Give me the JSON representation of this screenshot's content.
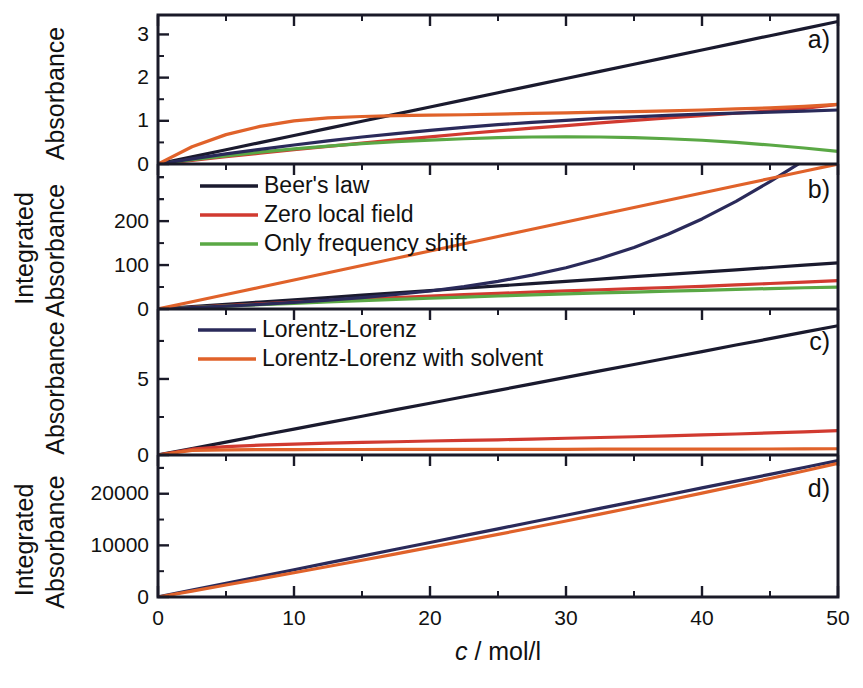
{
  "figure": {
    "xaxis": {
      "label_var": "c",
      "label_rest": " / mol/l",
      "ticks": [
        "0",
        "10",
        "20",
        "30",
        "40",
        "50"
      ],
      "min": 0,
      "max": 50
    },
    "panels": [
      {
        "tag": "a)",
        "ylabel": "Absorbance",
        "yticks": [
          "0",
          "1",
          "2",
          "3"
        ],
        "ymin": 0,
        "ymax": 3.45
      },
      {
        "tag": "b)",
        "ylabel_line1": "Integrated",
        "ylabel_line2": "Absorbance",
        "yticks": [
          "0",
          "100",
          "200"
        ],
        "ymin": 0,
        "ymax": 330
      },
      {
        "tag": "c)",
        "ylabel": "Absorbance",
        "yticks": [
          "0",
          "5"
        ],
        "ymin": 0,
        "ymax": 9.6
      },
      {
        "tag": "d)",
        "ylabel_line1": "Integrated",
        "ylabel_line2": "Absorbance",
        "yticks": [
          "0",
          "10000",
          "20000"
        ],
        "ymin": 0,
        "ymax": 27500
      }
    ],
    "legend_top": {
      "items": [
        {
          "label": "Beer's law",
          "color": "#1a1a2e"
        },
        {
          "label": "Zero local field",
          "color": "#d13a30"
        },
        {
          "label": "Only frequency shift",
          "color": "#5aa845"
        }
      ]
    },
    "legend_bottom": {
      "items": [
        {
          "label": "Lorentz-Lorenz",
          "color": "#2a2a5a"
        },
        {
          "label": "Lorentz-Lorenz with solvent",
          "color": "#e0622a"
        }
      ]
    },
    "colors": {
      "beers_law": "#1a1a2e",
      "zero_local_field": "#d13a30",
      "only_frequency_shift": "#5aa845",
      "lorentz_lorenz": "#2a2a5a",
      "lorentz_lorenz_solvent": "#e0622a"
    }
  },
  "chart_data": {
    "type": "line",
    "title": "",
    "xlabel": "c / mol/l",
    "grid": false,
    "legend_position": "inside-upper-left",
    "x": [
      0,
      2.5,
      5,
      7.5,
      10,
      12.5,
      15,
      17.5,
      20,
      22.5,
      25,
      27.5,
      30,
      32.5,
      35,
      37.5,
      40,
      42.5,
      45,
      47.5,
      50
    ],
    "panels": [
      {
        "tag": "a)",
        "ylabel": "Absorbance",
        "ylim": [
          0,
          3.45
        ],
        "yticks": [
          0,
          1,
          2,
          3
        ],
        "series": [
          {
            "name": "Beer's law",
            "color": "#1a1a2e",
            "values": [
              0,
              0.165,
              0.33,
              0.495,
              0.66,
              0.825,
              0.99,
              1.155,
              1.32,
              1.485,
              1.65,
              1.815,
              1.98,
              2.145,
              2.31,
              2.475,
              2.64,
              2.805,
              2.97,
              3.135,
              3.3
            ]
          },
          {
            "name": "Zero local field",
            "color": "#d13a30",
            "values": [
              0,
              0.085,
              0.17,
              0.25,
              0.33,
              0.41,
              0.485,
              0.56,
              0.63,
              0.7,
              0.765,
              0.83,
              0.89,
              0.95,
              1.01,
              1.065,
              1.12,
              1.175,
              1.23,
              1.29,
              1.38
            ]
          },
          {
            "name": "Only frequency shift",
            "color": "#5aa845",
            "values": [
              0,
              0.1,
              0.19,
              0.275,
              0.35,
              0.415,
              0.47,
              0.515,
              0.555,
              0.585,
              0.61,
              0.625,
              0.63,
              0.625,
              0.61,
              0.585,
              0.55,
              0.5,
              0.44,
              0.37,
              0.29
            ]
          },
          {
            "name": "Lorentz-Lorenz",
            "color": "#2a2a5a",
            "values": [
              0,
              0.12,
              0.235,
              0.34,
              0.44,
              0.535,
              0.625,
              0.705,
              0.78,
              0.85,
              0.91,
              0.965,
              1.01,
              1.055,
              1.09,
              1.125,
              1.155,
              1.18,
              1.2,
              1.225,
              1.25
            ]
          },
          {
            "name": "Lorentz-Lorenz with solvent",
            "color": "#e0622a",
            "values": [
              0,
              0.4,
              0.68,
              0.87,
              1.0,
              1.07,
              1.1,
              1.12,
              1.13,
              1.14,
              1.155,
              1.17,
              1.185,
              1.2,
              1.215,
              1.23,
              1.25,
              1.275,
              1.3,
              1.335,
              1.38
            ]
          }
        ]
      },
      {
        "tag": "b)",
        "ylabel": "Integrated Absorbance",
        "ylim": [
          0,
          330
        ],
        "yticks": [
          0,
          100,
          200
        ],
        "series": [
          {
            "name": "Beer's law",
            "color": "#1a1a2e",
            "values": [
              0,
              5.2,
              10.5,
              15.8,
              21.0,
              26.2,
              31.5,
              36.8,
              42.0,
              47.2,
              52.5,
              57.8,
              63.0,
              68.2,
              73.5,
              78.8,
              84.0,
              89.2,
              94.5,
              99.8,
              105.0
            ]
          },
          {
            "name": "Zero local field",
            "color": "#d13a30",
            "values": [
              0,
              4.0,
              8.0,
              11.8,
              15.5,
              19.2,
              22.7,
              26.1,
              29.4,
              32.5,
              35.5,
              38.4,
              41.2,
              43.8,
              46.4,
              48.9,
              51.3,
              54.8,
              58.0,
              61.2,
              64.5
            ]
          },
          {
            "name": "Only frequency shift",
            "color": "#5aa845",
            "values": [
              0,
              3.3,
              6.6,
              9.8,
              13.0,
              16.0,
              19.0,
              21.8,
              24.5,
              27.1,
              29.6,
              32.0,
              34.3,
              36.5,
              38.6,
              40.6,
              42.5,
              44.5,
              46.5,
              48.4,
              50.0
            ]
          },
          {
            "name": "Lorentz-Lorenz",
            "color": "#2a2a5a",
            "values": [
              0,
              3.0,
              6.5,
              10.5,
              15.0,
              20.0,
              26.0,
              33.0,
              41.0,
              51.0,
              63.0,
              77.0,
              94.0,
              115.0,
              140.0,
              170.0,
              205.0,
              245.0,
              290.0,
              338.0,
              395.0
            ]
          },
          {
            "name": "Lorentz-Lorenz with solvent",
            "color": "#e0622a",
            "values": [
              0,
              16.5,
              33.0,
              49.5,
              66.0,
              82.5,
              99.0,
              115.5,
              132.0,
              148.5,
              165.0,
              181.5,
              198.0,
              214.5,
              231.0,
              247.5,
              264.0,
              280.5,
              297.0,
              313.5,
              330.0
            ]
          }
        ]
      },
      {
        "tag": "c)",
        "ylabel": "Absorbance",
        "ylim": [
          0,
          9.6
        ],
        "yticks": [
          0,
          5
        ],
        "series": [
          {
            "name": "Lorentz-Lorenz",
            "color": "#1a1a2e",
            "values": [
              0,
              0.42,
              0.85,
              1.28,
              1.7,
              2.13,
              2.55,
              2.98,
              3.4,
              3.83,
              4.25,
              4.68,
              5.1,
              5.53,
              5.95,
              6.38,
              6.8,
              7.23,
              7.65,
              8.08,
              8.5
            ]
          },
          {
            "name": "Zero local field",
            "color": "#d13a30",
            "values": [
              0,
              0.38,
              0.55,
              0.65,
              0.72,
              0.78,
              0.83,
              0.87,
              0.92,
              0.96,
              1.0,
              1.05,
              1.1,
              1.15,
              1.2,
              1.26,
              1.32,
              1.38,
              1.45,
              1.52,
              1.6
            ]
          },
          {
            "name": "Lorentz-Lorenz with solvent",
            "color": "#e0622a",
            "values": [
              0,
              0.3,
              0.34,
              0.35,
              0.355,
              0.36,
              0.36,
              0.365,
              0.365,
              0.37,
              0.37,
              0.375,
              0.375,
              0.38,
              0.38,
              0.385,
              0.39,
              0.39,
              0.395,
              0.4,
              0.41
            ]
          }
        ]
      },
      {
        "tag": "d)",
        "ylabel": "Integrated Absorbance",
        "ylim": [
          0,
          27500
        ],
        "yticks": [
          0,
          10000,
          20000
        ],
        "series": [
          {
            "name": "Lorentz-Lorenz",
            "color": "#2a2a5a",
            "values": [
              0,
              1320,
              2640,
              3960,
              5280,
              6600,
              7920,
              9240,
              10560,
              11880,
              13200,
              14520,
              15840,
              17160,
              18480,
              19800,
              21120,
              22440,
              23760,
              25080,
              26400
            ]
          },
          {
            "name": "Lorentz-Lorenz with solvent",
            "color": "#e0622a",
            "values": [
              0,
              1150,
              2320,
              3500,
              4700,
              5900,
              7120,
              8350,
              9600,
              10860,
              12130,
              13420,
              14720,
              16040,
              17380,
              18740,
              20120,
              21520,
              22950,
              24400,
              25900
            ]
          }
        ]
      }
    ]
  }
}
